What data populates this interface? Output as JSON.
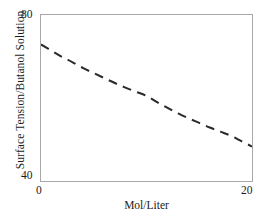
{
  "chart_data": {
    "type": "line",
    "title": "",
    "subtitle": "",
    "xlabel": "Mol/Liter",
    "ylabel": "Surface Tension/Butanol Solution",
    "xlim": [
      0,
      20
    ],
    "ylim": [
      40,
      80
    ],
    "xticks": [
      0,
      20
    ],
    "xtick_labels": [
      "0",
      "20"
    ],
    "yticks": [
      40,
      80
    ],
    "ytick_labels": [
      "40",
      "80"
    ],
    "grid": false,
    "legend": null,
    "legend_position": "none",
    "annotations": [],
    "series": [
      {
        "name": "Surface tension of butanol solution",
        "style": "dashed",
        "color": "#2b2b2b",
        "x": [
          0,
          1,
          2,
          3,
          4,
          5,
          6,
          7,
          8,
          9,
          10,
          11,
          12,
          13,
          14,
          15,
          16,
          17,
          18,
          19,
          20
        ],
        "y": [
          72.9,
          71.4,
          69.9,
          68.6,
          67.2,
          66.0,
          64.8,
          63.6,
          62.5,
          61.5,
          60.5,
          59.0,
          57.6,
          56.3,
          55.1,
          54.0,
          52.9,
          51.9,
          50.9,
          49.6,
          48.3
        ]
      }
    ]
  },
  "axes": {
    "y_title": "Surface Tension/Butanol Solution",
    "y_tick_top": "80",
    "y_tick_bottom": "40",
    "x_title": "Mol/Liter",
    "x_tick_left": "0",
    "x_tick_right": "20"
  },
  "colors": {
    "frame": "#a8a8a8",
    "curve": "#2b2b2b",
    "text": "#1c1c1c",
    "background": "#ffffff"
  }
}
